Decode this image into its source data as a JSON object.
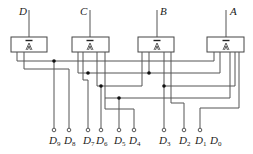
{
  "diagram": {
    "title": "",
    "gates": [
      {
        "id": "D",
        "label": "D",
        "x": 11,
        "input_x": 29
      },
      {
        "id": "C",
        "label": "C",
        "x": 72,
        "input_x": 90
      },
      {
        "id": "B",
        "label": "B",
        "x": 138,
        "input_x": 157
      },
      {
        "id": "A",
        "label": "A",
        "x": 207,
        "input_x": 226
      }
    ],
    "gate_symbol": "buffer-with-complement-output",
    "outputs": [
      {
        "label": "D",
        "sub": "9",
        "x": 54,
        "terminal": true
      },
      {
        "label": "D",
        "sub": "8",
        "x": 69,
        "terminal": true
      },
      {
        "label": "D",
        "sub": "7",
        "x": 88,
        "terminal": true
      },
      {
        "label": "D",
        "sub": "6",
        "x": 101,
        "terminal": true
      },
      {
        "label": "D",
        "sub": "5",
        "x": 119,
        "terminal": true
      },
      {
        "label": "D",
        "sub": "4",
        "x": 134,
        "terminal": true
      },
      {
        "label": "D",
        "sub": "3",
        "x": 164,
        "terminal": true
      },
      {
        "label": "D",
        "sub": "2",
        "x": 184,
        "terminal": true
      },
      {
        "label": "D",
        "sub": "1",
        "x": 200,
        "terminal": true
      },
      {
        "label": "D",
        "sub": "0",
        "x": 215,
        "terminal": false
      }
    ],
    "colors": {
      "wire": "#555555",
      "dot": "#111111",
      "background": "#ffffff"
    }
  }
}
